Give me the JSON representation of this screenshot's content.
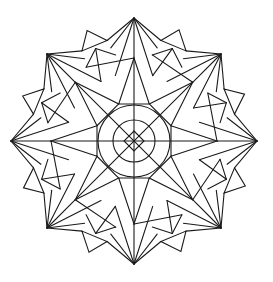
{
  "image": {
    "title": "Geometric mandala coloring page",
    "background": "#ffffff",
    "stroke_color": "#1a1a1a",
    "symmetry": 8,
    "center": [
      134,
      141
    ]
  },
  "mandala": {
    "outer_tip_radius": 123,
    "square_corner_radius": 122,
    "star_tip_radius": 83,
    "star_valley_radius": 40,
    "side_triangle_radius": 120,
    "side_triangle_offset_deg": 22,
    "circles": [
      36,
      21
    ],
    "center_diamond_radius": 10
  }
}
